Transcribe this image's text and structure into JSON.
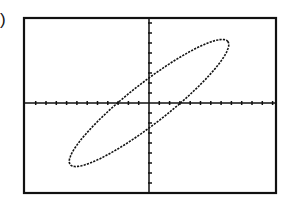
{
  "label": ")",
  "chart_data": {
    "type": "line",
    "title": "",
    "xlabel": "",
    "ylabel": "",
    "xlim": [
      -12,
      12
    ],
    "ylim": [
      -9,
      9
    ],
    "x_tick_count_positive": 12,
    "x_tick_count_negative": 12,
    "y_tick_count_positive": 8,
    "y_tick_count_negative": 9,
    "grid": false,
    "series": [
      {
        "name": "ellipse",
        "x": [
          8,
          7.9,
          6,
          3,
          0,
          -2,
          -4,
          -6,
          -7.7,
          -7.8,
          -6,
          -3,
          0,
          2,
          4,
          6,
          7.6
        ],
        "y": [
          6.6,
          5.8,
          2.2,
          -1.2,
          -3.4,
          -4.8,
          -5.6,
          -6.3,
          -6.3,
          -5.5,
          -2.3,
          1.2,
          3.8,
          4.8,
          5.7,
          6.2,
          6.5
        ]
      }
    ]
  },
  "colors": {
    "stroke": "#111111",
    "background": "#ffffff"
  }
}
